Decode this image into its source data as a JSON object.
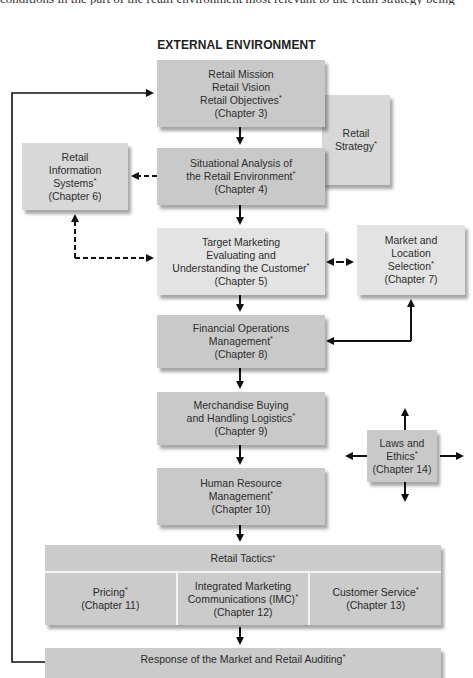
{
  "page": {
    "cut_text_line": "conditions in the part of the retail environment most relevant to the retail strategy being",
    "title": "EXTERNAL ENVIRONMENT"
  },
  "boxes": {
    "mission": {
      "lines": [
        "Retail Mission",
        "Retail Vision",
        "Retail Objectives"
      ],
      "chapter": "(Chapter 3)",
      "asterisk_line": 2
    },
    "strategy": {
      "lines": [
        "Retail",
        "Strategy"
      ],
      "asterisk_line": 1
    },
    "info_systems": {
      "lines": [
        "Retail",
        "Information",
        "Systems"
      ],
      "chapter": "(Chapter 6)",
      "asterisk_line": 2
    },
    "situational": {
      "lines": [
        "Situational Analysis of",
        "the Retail Environment"
      ],
      "chapter": "(Chapter 4)",
      "asterisk_line": 1
    },
    "target": {
      "lines": [
        "Target Marketing",
        "Evaluating and",
        "Understanding the Customer"
      ],
      "chapter": "(Chapter 5)",
      "asterisk_line": 2
    },
    "market_location": {
      "lines": [
        "Market and",
        "Location",
        "Selection"
      ],
      "chapter": "(Chapter 7)",
      "asterisk_line": 2
    },
    "financial": {
      "lines": [
        "Financial Operations",
        "Management"
      ],
      "chapter": "(Chapter 8)",
      "asterisk_line": 1
    },
    "merchandise": {
      "lines": [
        "Merchandise Buying",
        "and Handling Logistics"
      ],
      "chapter": "(Chapter 9)",
      "asterisk_line": 1
    },
    "laws": {
      "lines": [
        "Laws and",
        "Ethics"
      ],
      "chapter": "(Chapter 14)",
      "asterisk_line": 1
    },
    "hr": {
      "lines": [
        "Human Resource",
        "Management"
      ],
      "chapter": "(Chapter 10)",
      "asterisk_line": 1
    }
  },
  "tactics": {
    "header": "Retail Tactics",
    "cells": [
      {
        "lines": [
          "Pricing"
        ],
        "chapter": "(Chapter 11)"
      },
      {
        "lines": [
          "Integrated Marketing",
          "Communications (IMC)"
        ],
        "chapter": "(Chapter 12)"
      },
      {
        "lines": [
          "Customer Service"
        ],
        "chapter": "(Chapter 13)"
      }
    ]
  },
  "response": {
    "label": "Response of the Market and Retail Auditing"
  },
  "asterisk": "*",
  "colors": {
    "box_dark": "#c9c9c9",
    "box_light": "#e3e3e3",
    "arrow": "#111111",
    "background": "#ffffff"
  }
}
